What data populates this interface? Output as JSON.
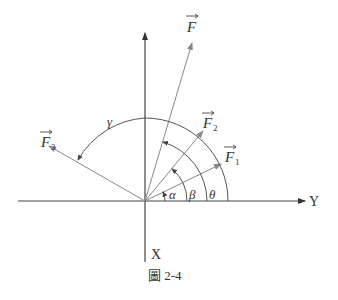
{
  "figure": {
    "caption": "圖 2-4",
    "axes": {
      "horizontal_label": "Y",
      "vertical_label": "X"
    },
    "vectors": [
      {
        "id": "F",
        "label": "F",
        "subscript": ""
      },
      {
        "id": "F1",
        "label": "F",
        "subscript": "1"
      },
      {
        "id": "F2",
        "label": "F",
        "subscript": "2"
      },
      {
        "id": "F3",
        "label": "F",
        "subscript": "3"
      }
    ],
    "angles": [
      {
        "id": "alpha",
        "label": "α"
      },
      {
        "id": "beta",
        "label": "β"
      },
      {
        "id": "theta",
        "label": "θ"
      },
      {
        "id": "gamma",
        "label": "γ"
      }
    ],
    "colors": {
      "axis": "#333333",
      "vector": "#888888",
      "arc": "#555555"
    }
  }
}
